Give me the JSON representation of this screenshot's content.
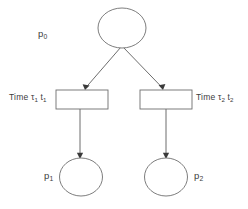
{
  "diagram": {
    "type": "petri-net",
    "background_color": "#ffffff",
    "line_color": "#6e6e6e",
    "text_color": "#3c3c3c",
    "places": [
      {
        "id": "p0",
        "label_text": "p",
        "label_sub": "0",
        "role": "input-place",
        "tokens": 0,
        "cx": 122,
        "cy": 28,
        "rx": 24,
        "ry": 20
      },
      {
        "id": "p1",
        "label_text": "p",
        "label_sub": "1",
        "role": "output-place",
        "tokens": 0,
        "cx": 81,
        "cy": 177,
        "rx": 21.5,
        "ry": 19
      },
      {
        "id": "p2",
        "label_text": "p",
        "label_sub": "2",
        "role": "output-place",
        "tokens": 0,
        "cx": 166,
        "cy": 177,
        "rx": 21.5,
        "ry": 19
      }
    ],
    "transitions": [
      {
        "id": "t1",
        "label_prefix": "Time",
        "label_tau": "τ",
        "label_tau_sub": "1",
        "label_name": "t",
        "label_name_sub": "1",
        "x": 56,
        "y": 90,
        "width": 52,
        "height": 19
      },
      {
        "id": "t2",
        "label_prefix": "Time",
        "label_tau": "τ",
        "label_tau_sub": "2",
        "label_name": "t",
        "label_name_sub": "2",
        "x": 140,
        "y": 90,
        "width": 52,
        "height": 19
      }
    ],
    "arcs": [
      {
        "id": "arc-p0-t1",
        "from": "p0",
        "to": "t1",
        "x1": 121,
        "y1": 47,
        "x2": 85,
        "y2": 89
      },
      {
        "id": "arc-p0-t2",
        "from": "p0",
        "to": "t2",
        "x1": 123,
        "y1": 47,
        "x2": 163,
        "y2": 89
      },
      {
        "id": "arc-t1-p1",
        "from": "t1",
        "to": "p1",
        "x1": 80,
        "y1": 109,
        "x2": 80,
        "y2": 157
      },
      {
        "id": "arc-t2-p2",
        "from": "t2",
        "to": "p2",
        "x1": 166,
        "y1": 109,
        "x2": 166,
        "y2": 157
      }
    ]
  }
}
